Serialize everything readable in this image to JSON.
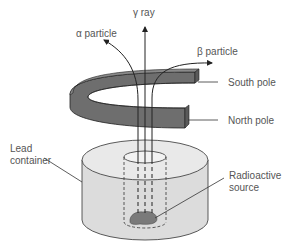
{
  "diagram": {
    "labels": {
      "gamma": "γ ray",
      "alpha": "α particle",
      "beta": "β particle",
      "south_pole": "South pole",
      "north_pole": "North pole",
      "lead_container_line1": "Lead",
      "lead_container_line2": "container",
      "source_line1": "Radioactive",
      "source_line2": "source"
    },
    "colors": {
      "magnet_side": "#6e6e6e",
      "magnet_top": "#8a8a8a",
      "container_side": "#dcdcdc",
      "container_top": "#e8e8e8",
      "source_blob": "#7a7a7a",
      "lines": "#222222",
      "label_text": "#555555"
    }
  }
}
